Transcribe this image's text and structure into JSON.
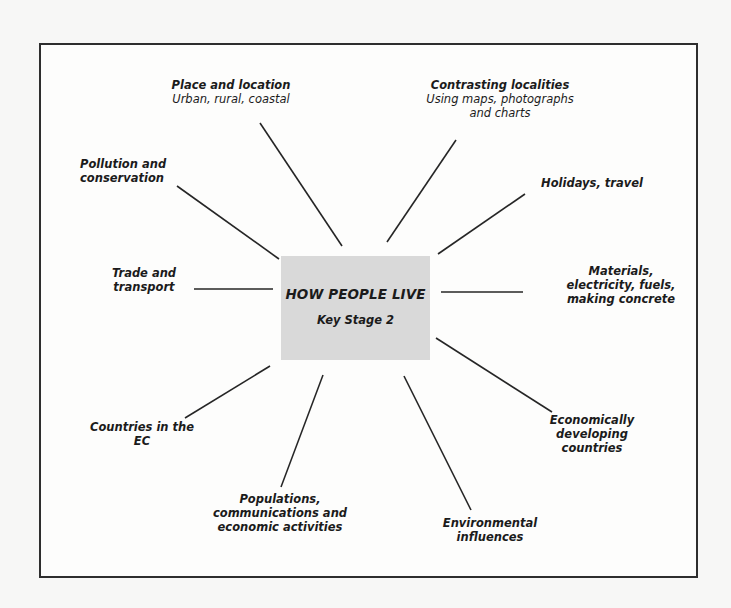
{
  "diagram": {
    "center": {
      "title": "HOW PEOPLE LIVE",
      "subtitle": "Key Stage 2",
      "fill_color": "#d9d9d9"
    },
    "nodes": [
      {
        "id": "place-and-location",
        "title_lines": [
          "Place and location"
        ],
        "sub_lines": [
          "Urban, rural, coastal"
        ]
      },
      {
        "id": "contrasting-localities",
        "title_lines": [
          "Contrasting localities"
        ],
        "sub_lines": [
          "Using maps, photographs",
          "and charts"
        ]
      },
      {
        "id": "pollution-and-conservation",
        "title_lines": [
          "Pollution and",
          "conservation"
        ],
        "sub_lines": []
      },
      {
        "id": "holidays-travel",
        "title_lines": [
          "Holidays, travel"
        ],
        "sub_lines": []
      },
      {
        "id": "trade-and-transport",
        "title_lines": [
          "Trade and",
          "transport"
        ],
        "sub_lines": []
      },
      {
        "id": "materials",
        "title_lines": [
          "Materials,",
          "electricity, fuels,",
          "making concrete"
        ],
        "sub_lines": []
      },
      {
        "id": "countries-in-the-ec",
        "title_lines": [
          "Countries in the",
          "EC"
        ],
        "sub_lines": []
      },
      {
        "id": "economically-developing-countries",
        "title_lines": [
          "Economically",
          "developing",
          "countries"
        ],
        "sub_lines": []
      },
      {
        "id": "populations",
        "title_lines": [
          "Populations,",
          "communications and",
          "economic activities"
        ],
        "sub_lines": []
      },
      {
        "id": "environmental-influences",
        "title_lines": [
          "Environmental",
          "influences"
        ],
        "sub_lines": []
      }
    ],
    "connectors": [
      {
        "to": "place-and-location",
        "x1": 260,
        "y1": 123,
        "x2": 342,
        "y2": 246
      },
      {
        "to": "contrasting-localities",
        "x1": 456,
        "y1": 140,
        "x2": 387,
        "y2": 242
      },
      {
        "to": "pollution-and-conservation",
        "x1": 177,
        "y1": 186,
        "x2": 279,
        "y2": 259
      },
      {
        "to": "holidays-travel",
        "x1": 525,
        "y1": 194,
        "x2": 438,
        "y2": 254
      },
      {
        "to": "trade-and-transport",
        "x1": 194,
        "y1": 289,
        "x2": 273,
        "y2": 289
      },
      {
        "to": "materials",
        "x1": 441,
        "y1": 292,
        "x2": 523,
        "y2": 292
      },
      {
        "to": "countries-in-the-ec",
        "x1": 270,
        "y1": 366,
        "x2": 185,
        "y2": 418
      },
      {
        "to": "economically-developing-countries",
        "x1": 436,
        "y1": 338,
        "x2": 552,
        "y2": 412
      },
      {
        "to": "populations",
        "x1": 323,
        "y1": 375,
        "x2": 281,
        "y2": 487
      },
      {
        "to": "environmental-influences",
        "x1": 404,
        "y1": 376,
        "x2": 471,
        "y2": 510
      }
    ]
  }
}
